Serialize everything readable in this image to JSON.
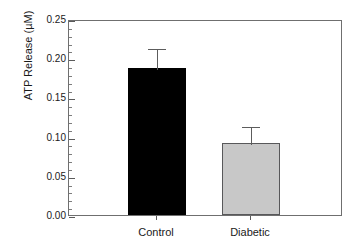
{
  "chart_data": {
    "type": "bar",
    "title": "",
    "xlabel": "",
    "ylabel": "ATP Release (µM)",
    "categories": [
      "Control",
      "Diabetic"
    ],
    "values": [
      0.187,
      0.092
    ],
    "errors": [
      0.027,
      0.023
    ],
    "series": [
      {
        "name": "ATP Release",
        "values": [
          0.187,
          0.092
        ],
        "errors": [
          0.027,
          0.023
        ]
      }
    ],
    "ylim": [
      0.0,
      0.25
    ],
    "ytick_labels": [
      "0.00",
      "0.05",
      "0.10",
      "0.15",
      "0.20",
      "0.25"
    ],
    "ytick_values": [
      0.0,
      0.05,
      0.1,
      0.15,
      0.2,
      0.25
    ],
    "yminor_step": 0.01,
    "grid": false,
    "legend": "none",
    "bar_colors": [
      "#000000",
      "#c8c8c8"
    ],
    "bar_edge_colors": [
      "#000000",
      "#58585a"
    ],
    "error_bar_color": "#5c5c5c",
    "axis_color": "#6f6f6f",
    "background_color": "#ffffff"
  },
  "axes": {
    "y": {
      "title": "ATP Release (µM)",
      "ticks": [
        {
          "label": "0.25",
          "value": 0.25
        },
        {
          "label": "0.20",
          "value": 0.2
        },
        {
          "label": "0.15",
          "value": 0.15
        },
        {
          "label": "0.10",
          "value": 0.1
        },
        {
          "label": "0.05",
          "value": 0.05
        },
        {
          "label": "0.00",
          "value": 0.0
        }
      ]
    },
    "x": {
      "ticks": [
        {
          "label": "Control"
        },
        {
          "label": "Diabetic"
        }
      ]
    }
  }
}
